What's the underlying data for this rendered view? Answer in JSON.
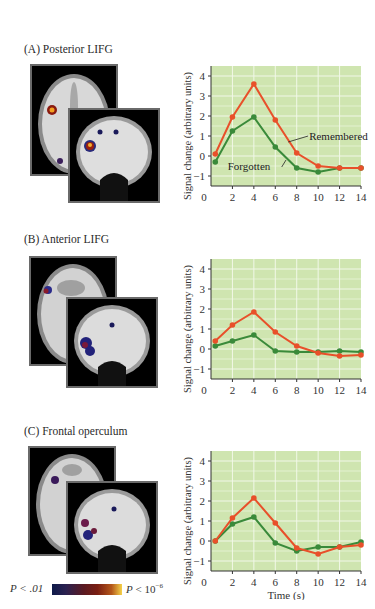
{
  "panels": [
    {
      "label": "(A)  Posterior LIFG"
    },
    {
      "label": "(B)  Anterior LIFG"
    },
    {
      "label": "(C)  Frontal operculum"
    }
  ],
  "colors": {
    "remembered": "#e8502a",
    "forgotten": "#3a8a3a",
    "plot_bg": "#cfe5b0",
    "grid": "#f2f8e8"
  },
  "scale_bar": {
    "left_label": "P < .01",
    "right_label_prefix": "P",
    "right_label_mid": " < 10",
    "right_label_exp": "−6"
  },
  "chart_data": [
    {
      "type": "line",
      "title": "(A) Posterior LIFG",
      "xlabel": "Time (s)",
      "ylabel": "Signal change (arbitrary units)",
      "x": [
        0,
        2,
        4,
        6,
        8,
        10,
        12,
        14
      ],
      "xticks": [
        0,
        2,
        4,
        6,
        8,
        10,
        12,
        14
      ],
      "yticks": [
        -1,
        0,
        1,
        2,
        3,
        4
      ],
      "ylim": [
        -1.5,
        4.5
      ],
      "xlim": [
        0,
        14
      ],
      "grid": true,
      "series": [
        {
          "name": "Remembered",
          "color": "#e8502a",
          "values": [
            0.1,
            1.95,
            3.6,
            1.8,
            0.15,
            -0.5,
            -0.6,
            -0.6
          ]
        },
        {
          "name": "Forgotten",
          "color": "#3a8a3a",
          "values": [
            -0.3,
            1.25,
            1.95,
            0.45,
            -0.6,
            -0.8,
            -0.6,
            -0.6
          ]
        }
      ],
      "annotations": [
        {
          "text": "Remembered",
          "x": 8.6,
          "y": 1.0
        },
        {
          "text": "Forgotten",
          "x": 1.0,
          "y": -0.5
        }
      ]
    },
    {
      "type": "line",
      "title": "(B) Anterior LIFG",
      "xlabel": "Time (s)",
      "ylabel": "Signal change (arbitrary units)",
      "x": [
        0,
        2,
        4,
        6,
        8,
        10,
        12,
        14
      ],
      "xticks": [
        0,
        2,
        4,
        6,
        8,
        10,
        12,
        14
      ],
      "yticks": [
        -1,
        0,
        1,
        2,
        3,
        4
      ],
      "ylim": [
        -1.5,
        4.5
      ],
      "xlim": [
        0,
        14
      ],
      "grid": true,
      "series": [
        {
          "name": "Remembered",
          "color": "#e8502a",
          "values": [
            0.4,
            1.2,
            1.85,
            0.85,
            0.15,
            -0.2,
            -0.35,
            -0.3
          ]
        },
        {
          "name": "Forgotten",
          "color": "#3a8a3a",
          "values": [
            0.15,
            0.4,
            0.7,
            -0.1,
            -0.15,
            -0.15,
            -0.1,
            -0.15
          ]
        }
      ],
      "annotations": []
    },
    {
      "type": "line",
      "title": "(C) Frontal operculum",
      "xlabel": "Time (s)",
      "ylabel": "Signal change (arbitrary units)",
      "x": [
        0,
        2,
        4,
        6,
        8,
        10,
        12,
        14
      ],
      "xticks": [
        0,
        2,
        4,
        6,
        8,
        10,
        12,
        14
      ],
      "yticks": [
        -1,
        0,
        1,
        2,
        3,
        4
      ],
      "ylim": [
        -1.5,
        4.5
      ],
      "xlim": [
        0,
        14
      ],
      "grid": true,
      "series": [
        {
          "name": "Remembered",
          "color": "#e8502a",
          "values": [
            0.0,
            1.15,
            2.15,
            0.9,
            -0.35,
            -0.65,
            -0.3,
            -0.2
          ]
        },
        {
          "name": "Forgotten",
          "color": "#3a8a3a",
          "values": [
            0.0,
            0.85,
            1.2,
            -0.1,
            -0.5,
            -0.3,
            -0.3,
            -0.05
          ]
        }
      ],
      "annotations": []
    }
  ]
}
